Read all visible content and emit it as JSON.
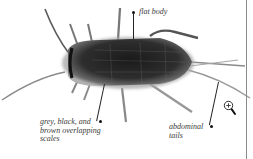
{
  "illustration": {
    "subject": "silverfish insect",
    "colors": {
      "body_dark": "#1e1e1e",
      "body_mid": "#4a4a4a",
      "fringe": "#9a9a9a",
      "appendage": "#6e6e6e",
      "label_text": "#3a3a3a",
      "divider": "#8a8a8a"
    }
  },
  "labels": {
    "flat_body": "flat body",
    "scales": "grey, black, and\nbrown overlapping\nscales",
    "tails": "abdominal\ntails"
  },
  "icons": {
    "zoom": "zoom-in-magnifier-icon"
  }
}
